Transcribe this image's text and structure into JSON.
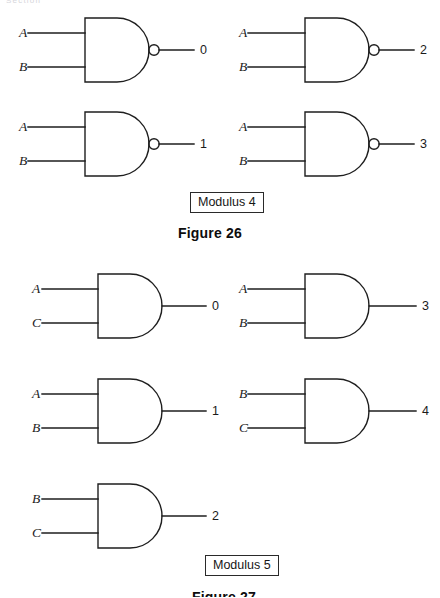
{
  "running_head": "Section",
  "figures": [
    {
      "id": "figure-26",
      "caption": "Figure 26",
      "modulus_label": "Modulus 4",
      "gate_type": "NAND",
      "gates": [
        {
          "inputs": [
            "A",
            "B"
          ],
          "output": "0"
        },
        {
          "inputs": [
            "A",
            "B"
          ],
          "output": "2"
        },
        {
          "inputs": [
            "A",
            "B"
          ],
          "output": "1"
        },
        {
          "inputs": [
            "A",
            "B"
          ],
          "output": "3"
        }
      ]
    },
    {
      "id": "figure-27",
      "caption": "Figure 27",
      "modulus_label": "Modulus 5",
      "gate_type": "AND",
      "gates": [
        {
          "inputs": [
            "A",
            "C"
          ],
          "output": "0"
        },
        {
          "inputs": [
            "A",
            "B"
          ],
          "output": "3"
        },
        {
          "inputs": [
            "A",
            "B"
          ],
          "output": "1"
        },
        {
          "inputs": [
            "B",
            "C"
          ],
          "output": "4"
        },
        {
          "inputs": [
            "B",
            "C"
          ],
          "output": "2"
        }
      ]
    }
  ]
}
